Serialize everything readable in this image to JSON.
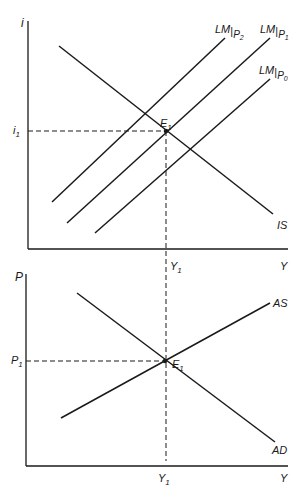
{
  "colors": {
    "line": "#1a1a1a",
    "background": "#ffffff"
  },
  "top_panel": {
    "y_axis_label": "i",
    "x_axis_label": "Y",
    "i1_label": "i",
    "i1_sub": "1",
    "y1_label": "Y",
    "y1_sub": "1",
    "equilibrium_label": "E",
    "equilibrium_sub": "1",
    "is_label": "IS",
    "lm_curves": [
      {
        "main": "LM",
        "sub_var": "P",
        "sub_idx": "2"
      },
      {
        "main": "LM",
        "sub_var": "P",
        "sub_idx": "1"
      },
      {
        "main": "LM",
        "sub_var": "P",
        "sub_idx": "0"
      }
    ]
  },
  "bottom_panel": {
    "y_axis_label": "P",
    "x_axis_label": "Y",
    "p1_label": "P",
    "p1_sub": "1",
    "y1_label": "Y",
    "y1_sub": "1",
    "equilibrium_label": "E",
    "equilibrium_sub": "1",
    "as_label": "AS",
    "ad_label": "AD"
  }
}
